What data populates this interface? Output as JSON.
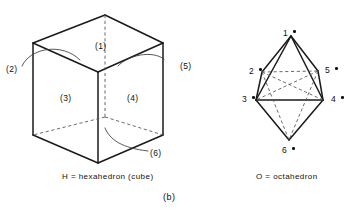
{
  "figure": {
    "panel_label": "(b)",
    "diagram_type": "geometric-solids-illustration"
  },
  "hexahedron": {
    "caption": "H = hexahedron (cube)",
    "name": "hexahedron",
    "face_labels": [
      {
        "id": "face-1",
        "text": "(1)",
        "face": "top",
        "x": 95,
        "y": 41
      },
      {
        "id": "face-2",
        "text": "(2)",
        "face": "left-back",
        "x": 6,
        "y": 64
      },
      {
        "id": "face-3",
        "text": "(3)",
        "face": "left-front",
        "x": 60,
        "y": 93
      },
      {
        "id": "face-4",
        "text": "(4)",
        "face": "right-front",
        "x": 127,
        "y": 93
      },
      {
        "id": "face-5",
        "text": "(5)",
        "face": "right-back",
        "x": 180,
        "y": 61
      },
      {
        "id": "face-6",
        "text": "(6)",
        "face": "bottom",
        "x": 150,
        "y": 148
      }
    ]
  },
  "octahedron": {
    "caption": "O = octahedron",
    "name": "octahedron",
    "vertex_labels": [
      {
        "id": "vertex-1",
        "text": "1",
        "x": 283,
        "y": 28,
        "dot_x": 293,
        "dot_y": 30
      },
      {
        "id": "vertex-2",
        "text": "2",
        "x": 249,
        "y": 66,
        "dot_x": 259,
        "dot_y": 68
      },
      {
        "id": "vertex-5",
        "text": "5",
        "x": 325,
        "y": 65,
        "dot_x": 335,
        "dot_y": 67
      },
      {
        "id": "vertex-3",
        "text": "3",
        "x": 242,
        "y": 94,
        "dot_x": 252,
        "dot_y": 96
      },
      {
        "id": "vertex-4",
        "text": "4",
        "x": 331,
        "y": 94,
        "dot_x": 341,
        "dot_y": 96
      },
      {
        "id": "vertex-6",
        "text": "6",
        "x": 282,
        "y": 145,
        "dot_x": 292,
        "dot_y": 147
      }
    ]
  },
  "colors": {
    "stroke": "#1a1a1a",
    "hidden_stroke": "#5a5a5a",
    "leader_stroke": "#3a3a3a",
    "background": "#ffffff",
    "text": "#111111"
  }
}
